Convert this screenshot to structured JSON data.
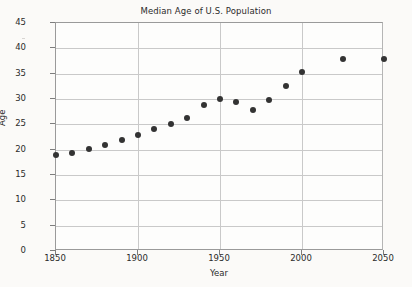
{
  "chart_data": {
    "type": "scatter",
    "title": "Median Age of U.S. Population",
    "xlabel": "Year",
    "ylabel": "Age",
    "xlim": [
      1850,
      2050
    ],
    "ylim": [
      0,
      45
    ],
    "xticks": [
      1850,
      1900,
      1950,
      2000,
      2050
    ],
    "yticks": [
      0,
      5,
      10,
      15,
      20,
      25,
      30,
      35,
      40,
      45
    ],
    "grid": "horizontal-and-vertical",
    "legend": null,
    "marker": "filled-circle",
    "marker_color": "#333333",
    "x": [
      1850,
      1860,
      1870,
      1880,
      1890,
      1900,
      1910,
      1920,
      1930,
      1940,
      1950,
      1960,
      1970,
      1980,
      1990,
      2000,
      2025,
      2050
    ],
    "values": [
      18.9,
      19.4,
      20.2,
      20.9,
      22.0,
      22.9,
      24.1,
      25.1,
      26.3,
      28.9,
      30.0,
      29.4,
      27.9,
      29.8,
      32.6,
      35.4,
      37.8,
      37.9
    ],
    "points": [
      {
        "year": 1850,
        "age": 18.9
      },
      {
        "year": 1860,
        "age": 19.4
      },
      {
        "year": 1870,
        "age": 20.2
      },
      {
        "year": 1880,
        "age": 20.9
      },
      {
        "year": 1890,
        "age": 22.0
      },
      {
        "year": 1900,
        "age": 22.9
      },
      {
        "year": 1910,
        "age": 24.1
      },
      {
        "year": 1920,
        "age": 25.1
      },
      {
        "year": 1930,
        "age": 26.3
      },
      {
        "year": 1940,
        "age": 28.9
      },
      {
        "year": 1950,
        "age": 30.0
      },
      {
        "year": 1960,
        "age": 29.4
      },
      {
        "year": 1970,
        "age": 27.9
      },
      {
        "year": 1980,
        "age": 29.8
      },
      {
        "year": 1990,
        "age": 32.6
      },
      {
        "year": 2000,
        "age": 35.4
      },
      {
        "year": 2025,
        "age": 37.8
      },
      {
        "year": 2050,
        "age": 37.9
      }
    ]
  },
  "colors": {
    "marker": "#333333",
    "grid": "#c9c9c9",
    "axis": "#9a9a9a",
    "text": "#2b2b2b",
    "background": "#fbfaf8"
  }
}
